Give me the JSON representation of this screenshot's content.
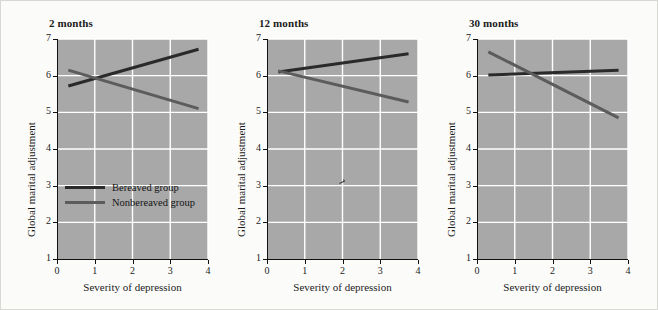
{
  "figure": {
    "background_color": "#fbfbfa",
    "plot_background_color": "#a8a8a8",
    "grid_color": "#ffffff",
    "axis_color": "#111111"
  },
  "legend": {
    "position": "inside-first-panel-lower-left",
    "entries": [
      {
        "label": "Bereaved group",
        "color": "#2a2a2a"
      },
      {
        "label": "Nonbereaved group",
        "color": "#5c5c5c"
      }
    ]
  },
  "axes": {
    "xlabel": "Severity of depression",
    "ylabel": "Global marital adjustment",
    "xticks": [
      "0",
      "1",
      "2",
      "3",
      "4"
    ],
    "yticks": [
      "1",
      "2",
      "3",
      "4",
      "5",
      "6",
      "7"
    ],
    "xlim": [
      0,
      4
    ],
    "ylim": [
      1,
      7
    ]
  },
  "chart_data": {
    "type": "line",
    "title": "",
    "xlabel": "Severity of depression",
    "ylabel": "Global marital adjustment",
    "xlim": [
      0,
      4
    ],
    "ylim": [
      1,
      7
    ],
    "xticks": [
      0,
      1,
      2,
      3,
      4
    ],
    "yticks": [
      1,
      2,
      3,
      4,
      5,
      6,
      7
    ],
    "grid": true,
    "legend": [
      "Bereaved group",
      "Nonbereaved group"
    ],
    "legend_position": "inside lower-left of first panel",
    "panels": [
      {
        "title": "2 months",
        "series": [
          {
            "name": "Bereaved group",
            "color": "#2a2a2a",
            "x": [
              0.3,
              3.75
            ],
            "y": [
              5.72,
              6.72
            ]
          },
          {
            "name": "Nonbereaved group",
            "color": "#5c5c5c",
            "x": [
              0.3,
              3.75
            ],
            "y": [
              6.15,
              5.1
            ]
          }
        ],
        "annotations": []
      },
      {
        "title": "12 months",
        "series": [
          {
            "name": "Bereaved group",
            "color": "#2a2a2a",
            "x": [
              0.3,
              3.75
            ],
            "y": [
              6.1,
              6.6
            ]
          },
          {
            "name": "Nonbereaved group",
            "color": "#5c5c5c",
            "x": [
              0.3,
              3.75
            ],
            "y": [
              6.13,
              5.28
            ]
          }
        ],
        "annotations": [
          {
            "type": "stray-mark",
            "x": 2.0,
            "y": 3.1
          }
        ]
      },
      {
        "title": "30 months",
        "series": [
          {
            "name": "Bereaved group",
            "color": "#2a2a2a",
            "x": [
              0.3,
              3.75
            ],
            "y": [
              6.02,
              6.15
            ]
          },
          {
            "name": "Nonbereaved group",
            "color": "#5c5c5c",
            "x": [
              0.3,
              3.75
            ],
            "y": [
              6.65,
              4.85
            ]
          }
        ],
        "annotations": []
      }
    ]
  }
}
